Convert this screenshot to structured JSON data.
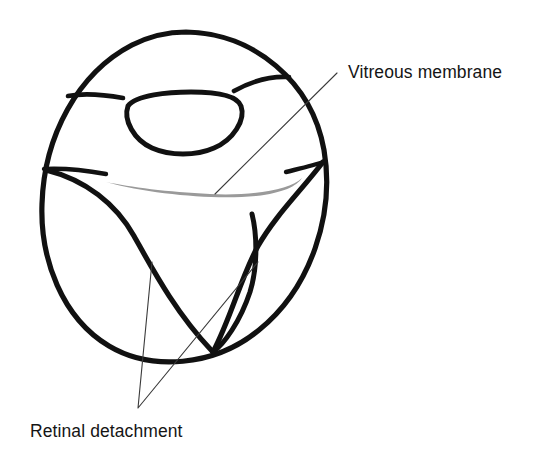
{
  "figure": {
    "background_color": "#ffffff",
    "ink_color": "#111111",
    "membrane_color": "#9a9a9a",
    "leader_color": "#3a3a3a",
    "width": 536,
    "height": 457
  },
  "labels": {
    "vitreous_membrane": "Vitreous membrane",
    "retinal_detachment": "Retinal detachment"
  },
  "annotations": [
    {
      "id": "vitreous-membrane",
      "text": "Vitreous membrane",
      "text_x": 348,
      "text_y": 78,
      "anchor": "start",
      "leader": "M 337 73 L 215 194"
    },
    {
      "id": "retinal-detachment",
      "text": "Retinal detachment",
      "text_x": 30,
      "text_y": 437,
      "anchor": "start",
      "leader": "M 152 262 L 138 408 M 138 408 L 258 262"
    }
  ],
  "structures": {
    "globe": {
      "name": "eye-globe-outline",
      "stroke_width": 5.2,
      "path": "M 186 32 C 254 33 312 82 324 150 C 335 214 311 288 259 330 C 214 367 151 371 109 346 C 62 318 40 259 42 204 C 44 136 78 73 132 45 C 150 36 168 32 186 32 Z"
    },
    "lens": {
      "name": "lens-outline",
      "stroke_width": 5.0,
      "path": "M 128 106 C 136 95 168 92 191 92 C 214 92 237 95 241 106 C 246 120 233 140 214 148 C 196 156 170 156 152 148 C 134 140 123 120 128 106 Z"
    },
    "ciliary_arc_left": {
      "name": "ciliary-arc-left",
      "stroke_width": 4.6,
      "path": "M 68 96 C 84 93 106 95 123 98"
    },
    "ciliary_arc_right": {
      "name": "ciliary-arc-right",
      "stroke_width": 4.6,
      "path": "M 234 91 C 252 81 272 76 289 77"
    },
    "ora_line_left": {
      "name": "ora-serrata-line-left",
      "stroke_width": 4.4,
      "path": "M 44 169 C 62 168 84 170 106 174"
    },
    "ora_line_right": {
      "name": "ora-serrata-line-right",
      "stroke_width": 4.4,
      "path": "M 286 172 C 302 168 315 165 323 162"
    },
    "retina_flap_left": {
      "name": "detached-retina-flap-left",
      "stroke_width": 5.2,
      "path": "M 46 170 C 86 180 116 204 134 236 C 152 268 175 312 212 351"
    },
    "retina_flap_right": {
      "name": "detached-retina-flap-right",
      "stroke_width": 5.2,
      "path": "M 323 162 C 300 192 275 216 258 246 C 241 277 231 318 213 352"
    },
    "funnel_stalk": {
      "name": "retinal-funnel-stalk",
      "stroke_width": 5.0,
      "path": "M 213 352 C 224 344 240 322 250 292 C 258 266 257 234 252 214"
    },
    "vitreous_membrane_band": {
      "name": "vitreous-membrane-band",
      "fill": "#9a9a9a",
      "path": "M 106 182 C 150 194 212 200 256 196 C 283 193 297 186 302 178 C 290 190 252 196 210 194 C 168 192 130 187 106 182 Z"
    }
  }
}
